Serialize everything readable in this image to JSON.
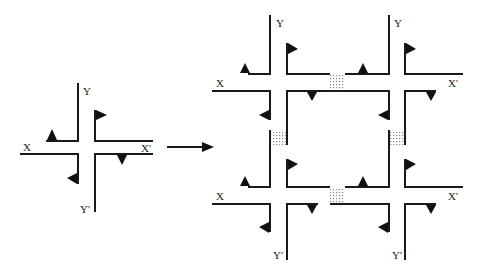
{
  "diagram": {
    "colors": {
      "line": "#1a1a1a",
      "background": "#ffffff",
      "stipple": "#888888"
    },
    "single": {
      "labels": {
        "x": "X",
        "x_prime": "X'",
        "y": "Y",
        "y_prime": "Y'"
      }
    },
    "arrow": {
      "direction": "right"
    },
    "grid": {
      "top_left": {
        "x": "X",
        "y": "Y"
      },
      "top_right": {
        "x_prime": "X'",
        "y": "Y"
      },
      "bottom_left": {
        "x": "X",
        "y_prime": "Y'"
      },
      "bottom_right": {
        "x_prime": "X'",
        "y_prime": "Y'"
      }
    }
  }
}
